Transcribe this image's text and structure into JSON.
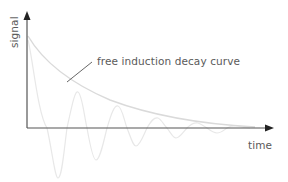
{
  "diagram": {
    "title": "",
    "y_axis_label": "signal",
    "x_axis_label": "time",
    "annotation": "free induction decay curve",
    "colors": {
      "axis": "#444444",
      "envelope": "#dcdcdc",
      "oscillation": "#ececec",
      "leader_line": "#555555",
      "text": "#5a5a5a"
    }
  }
}
